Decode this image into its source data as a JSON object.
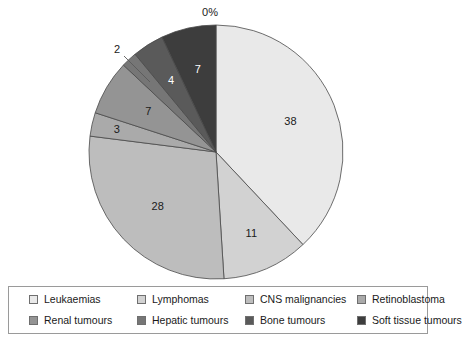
{
  "chart_data": {
    "type": "pie",
    "title": "",
    "subtitle": "",
    "xlabel": "",
    "ylabel": "",
    "legend_position": "bottom",
    "grid": false,
    "value_suffix": "",
    "categories": [
      "Leukaemias",
      "Lymphomas",
      "CNS malignancies",
      "Retinoblastoma",
      "Renal tumours",
      "Hepatic tumours",
      "Bone tumours",
      "Soft tissue tumours"
    ],
    "values": [
      38,
      11,
      28,
      3,
      7,
      2,
      4,
      7
    ],
    "colors": [
      "#e9e9e9",
      "#d2d2d2",
      "#bdbdbd",
      "#aaaaaa",
      "#949494",
      "#767676",
      "#5a5a5a",
      "#3d3d3d"
    ],
    "slice_labels": [
      "38",
      "11",
      "28",
      "3",
      "7",
      "2",
      "4",
      "7"
    ],
    "annotations": [
      {
        "text": "0%",
        "note": "zero-value slice label at top of pie"
      }
    ]
  },
  "pie": {
    "zero_label": "0%",
    "labels": {
      "leukaemias": "38",
      "lymphomas": "11",
      "cns": "28",
      "retinoblastoma": "3",
      "renal": "7",
      "hepatic": "2",
      "bone": "4",
      "soft_tissue": "7"
    }
  },
  "legend": {
    "items": [
      {
        "label": "Leukaemias",
        "color": "#e9e9e9"
      },
      {
        "label": "Lymphomas",
        "color": "#d2d2d2"
      },
      {
        "label": "CNS malignancies",
        "color": "#bdbdbd"
      },
      {
        "label": "Retinoblastoma",
        "color": "#aaaaaa"
      },
      {
        "label": "Renal tumours",
        "color": "#949494"
      },
      {
        "label": "Hepatic tumours",
        "color": "#767676"
      },
      {
        "label": "Bone tumours",
        "color": "#5a5a5a"
      },
      {
        "label": "Soft tissue tumours",
        "color": "#3d3d3d"
      }
    ]
  }
}
